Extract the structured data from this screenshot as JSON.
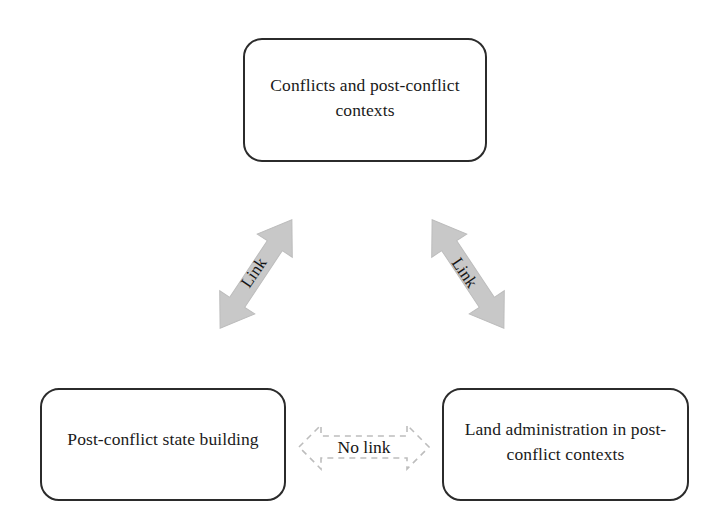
{
  "figure": {
    "type": "concept-relationship-diagram",
    "background_color": "#ffffff",
    "width": 722,
    "height": 527
  },
  "nodes": [
    {
      "id": "conflicts-and-post-conflict-contexts",
      "label": "Conflicts and post-conflict contexts",
      "position": "top-center",
      "border_color": "#2b2b2b",
      "fill_color": "#ffffff"
    },
    {
      "id": "post-conflict-state-building",
      "label": "Post-conflict state building",
      "position": "bottom-left",
      "border_color": "#2b2b2b",
      "fill_color": "#ffffff"
    },
    {
      "id": "land-administration-in-post-conflict-contexts",
      "label": "Land administration in post-conflict contexts",
      "position": "bottom-right",
      "border_color": "#2b2b2b",
      "fill_color": "#ffffff"
    }
  ],
  "connectors": [
    {
      "id": "link-left",
      "label": "Link",
      "style": "solid-filled-double-arrow",
      "color": "#c8c8c8",
      "from": "post-conflict-state-building",
      "to": "conflicts-and-post-conflict-contexts",
      "direction": "bidirectional"
    },
    {
      "id": "link-right",
      "label": "Link",
      "style": "solid-filled-double-arrow",
      "color": "#c8c8c8",
      "from": "conflicts-and-post-conflict-contexts",
      "to": "land-administration-in-post-conflict-contexts",
      "direction": "bidirectional"
    },
    {
      "id": "no-link-bottom",
      "label": "No link",
      "style": "dashed-outline-double-arrow",
      "color": "#bdbdbd",
      "from": "post-conflict-state-building",
      "to": "land-administration-in-post-conflict-contexts",
      "direction": "bidirectional"
    }
  ]
}
